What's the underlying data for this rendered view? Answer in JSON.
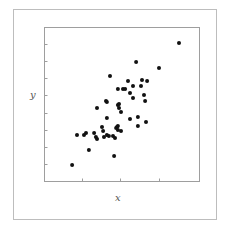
{
  "chart_data": {
    "type": "scatter",
    "title": "",
    "xlabel": "x",
    "ylabel": "y",
    "xlim": [
      0,
      10
    ],
    "ylim": [
      0,
      10
    ],
    "grid": false,
    "legend": null,
    "x_ticks_count": 3,
    "y_ticks_count": 8,
    "marker_color": "#111111",
    "points": [
      [
        8.71,
        8.97
      ],
      [
        5.94,
        7.74
      ],
      [
        7.42,
        7.35
      ],
      [
        4.26,
        6.84
      ],
      [
        5.42,
        6.52
      ],
      [
        6.32,
        6.58
      ],
      [
        6.65,
        6.52
      ],
      [
        5.74,
        6.19
      ],
      [
        6.26,
        6.19
      ],
      [
        4.77,
        6.0
      ],
      [
        5.1,
        6.0
      ],
      [
        5.23,
        6.0
      ],
      [
        5.55,
        5.74
      ],
      [
        6.45,
        5.61
      ],
      [
        5.74,
        5.42
      ],
      [
        6.52,
        5.23
      ],
      [
        4.0,
        5.23
      ],
      [
        4.77,
        4.97
      ],
      [
        4.84,
        4.77
      ],
      [
        4.97,
        4.52
      ],
      [
        3.42,
        4.77
      ],
      [
        4.06,
        4.13
      ],
      [
        5.55,
        4.06
      ],
      [
        6.06,
        4.19
      ],
      [
        6.58,
        3.87
      ],
      [
        6.06,
        3.61
      ],
      [
        4.77,
        3.61
      ],
      [
        4.65,
        3.48
      ],
      [
        4.97,
        3.29
      ],
      [
        3.74,
        3.55
      ],
      [
        3.81,
        3.29
      ],
      [
        4.71,
        3.55
      ],
      [
        2.13,
        3.03
      ],
      [
        2.58,
        3.03
      ],
      [
        2.71,
        3.16
      ],
      [
        3.23,
        3.16
      ],
      [
        3.35,
        2.9
      ],
      [
        3.42,
        2.77
      ],
      [
        3.87,
        2.9
      ],
      [
        4.06,
        3.03
      ],
      [
        4.19,
        2.97
      ],
      [
        4.45,
        2.97
      ],
      [
        4.58,
        2.84
      ],
      [
        4.77,
        3.35
      ],
      [
        2.9,
        2.06
      ],
      [
        4.52,
        1.68
      ],
      [
        1.81,
        1.1
      ],
      [
        4.84,
        5.03
      ],
      [
        4.06,
        5.16
      ]
    ]
  },
  "labels": {
    "x": "x",
    "y": "y"
  }
}
